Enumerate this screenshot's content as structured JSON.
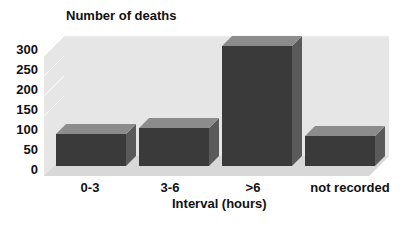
{
  "chart_data": {
    "type": "bar",
    "title": "Number of deaths",
    "xlabel": "Interval (hours)",
    "ylabel": "Number of deaths",
    "categories": [
      "0-3",
      "3-6",
      ">6",
      "not recorded"
    ],
    "values": [
      80,
      95,
      300,
      75
    ],
    "yticks": [
      "300",
      "250",
      "200",
      "150",
      "100",
      "50",
      "0"
    ],
    "ylim": [
      0,
      300
    ],
    "grid": false,
    "style": "3d",
    "bar_color": "#3a3a3a",
    "wall_color": "#e4e4e4"
  }
}
